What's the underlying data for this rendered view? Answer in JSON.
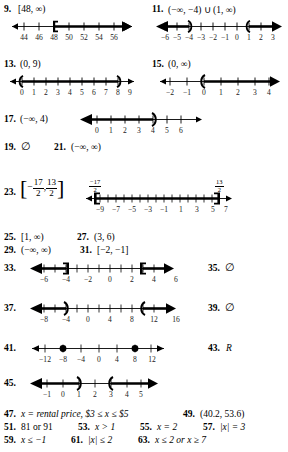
{
  "page": {
    "type": "answer-key",
    "background": "#ffffff",
    "ink": "#000000"
  },
  "exercises": [
    {
      "number": "9.",
      "answer": "[48, ∞)",
      "graph": {
        "ticks": [
          "44",
          "46",
          "48",
          "50",
          "52",
          "54",
          "56"
        ],
        "marks": [
          {
            "at": 2,
            "glyph": "[",
            "direction": "right"
          }
        ],
        "arrows": [
          "left",
          "right"
        ]
      }
    },
    {
      "number": "11.",
      "answer": "(−∞, −4) ∪ (1, ∞)",
      "graph": {
        "ticks": [
          "−6",
          "−5",
          "−4",
          "−3",
          "−2",
          "−1",
          "0",
          "1",
          "2",
          "3"
        ],
        "marks": [
          {
            "at": 2,
            "glyph": ")",
            "direction": "left"
          },
          {
            "at": 7,
            "glyph": "(",
            "direction": "right"
          }
        ],
        "arrows": [
          "left",
          "right"
        ]
      }
    },
    {
      "number": "13.",
      "answer": "(0, 9)",
      "graph": {
        "ticks": [
          "0",
          "1",
          "2",
          "3",
          "4",
          "5",
          "6",
          "7",
          "8",
          "9"
        ],
        "marks": [
          {
            "at": 0,
            "glyph": "(",
            "direction": "right"
          },
          {
            "at": 9,
            "glyph": ")",
            "direction": "left"
          }
        ],
        "arrows": [
          "left",
          "right"
        ]
      }
    },
    {
      "number": "15.",
      "answer": "(0, ∞)",
      "graph": {
        "ticks": [
          "−2",
          "−1",
          "0",
          "1",
          "2",
          "3",
          "4"
        ],
        "marks": [
          {
            "at": 2,
            "glyph": "(",
            "direction": "right"
          }
        ],
        "arrows": [
          "left",
          "right"
        ]
      }
    },
    {
      "number": "17.",
      "answer": "(−∞, 4)",
      "graph": {
        "ticks": [
          "0",
          "1",
          "2",
          "3",
          "4",
          "5",
          "6"
        ],
        "marks": [
          {
            "at": 4,
            "glyph": ")",
            "direction": "left"
          }
        ],
        "arrows": [
          "left",
          "right"
        ]
      }
    },
    {
      "number": "19.",
      "answer": "∅"
    },
    {
      "number": "21.",
      "answer": "(−∞, ∞)"
    },
    {
      "number": "23.",
      "answer_fraction": {
        "left_bracket": "[",
        "a_num": "17",
        "a_den": "2",
        "a_sign": "−",
        "b_num": "13",
        "b_den": "2",
        "right_bracket": "]"
      },
      "graph": {
        "ticks": [
          "−9",
          "−7",
          "−5",
          "−3",
          "−1",
          "1",
          "3",
          "5",
          "7"
        ],
        "endpoint_labels": [
          {
            "num": "17",
            "den": "2",
            "sign": "−",
            "side": "left"
          },
          {
            "num": "13",
            "den": "2",
            "sign": "",
            "side": "right"
          }
        ],
        "marks": [
          {
            "glyph": "[",
            "direction": "right"
          },
          {
            "glyph": "]",
            "direction": "left"
          }
        ],
        "arrows": [
          "left",
          "right"
        ]
      }
    },
    {
      "number": "25.",
      "answer": "[1, ∞)"
    },
    {
      "number": "27.",
      "answer": "(3, 6)"
    },
    {
      "number": "29.",
      "answer": "(−∞, ∞)"
    },
    {
      "number": "31.",
      "answer": "[−2, −1]"
    },
    {
      "number": "33.",
      "graph": {
        "ticks": [
          "−6",
          "",
          "−4",
          "",
          "−2",
          "",
          "0",
          "",
          "2",
          "",
          "4",
          "",
          "6"
        ],
        "marks": [
          {
            "at": 2,
            "glyph": "]",
            "direction": "left"
          },
          {
            "at": 10,
            "glyph": "[",
            "direction": "right"
          }
        ],
        "arrows": [
          "left",
          "right"
        ]
      }
    },
    {
      "number": "35.",
      "answer": "∅"
    },
    {
      "number": "37.",
      "graph": {
        "ticks": [
          "−8",
          "",
          "−4",
          "",
          "0",
          "",
          "4",
          "",
          "8",
          "",
          "12",
          "",
          "16"
        ],
        "marks": [
          {
            "at": 2,
            "glyph": ")",
            "direction": "left"
          },
          {
            "at": 10,
            "glyph": "(",
            "direction": "right"
          }
        ],
        "arrows": [
          "left",
          "right"
        ]
      }
    },
    {
      "number": "39.",
      "answer": "∅"
    },
    {
      "number": "41.",
      "graph": {
        "ticks": [
          "−12",
          "−8",
          "−4",
          "0",
          "4",
          "8",
          "12"
        ],
        "dots": [
          1,
          5
        ],
        "arrows": [
          "left",
          "right"
        ],
        "line": "thin"
      }
    },
    {
      "number": "43.",
      "answer": "R",
      "italic": true
    },
    {
      "number": "45.",
      "graph": {
        "ticks": [
          "−1",
          "0",
          "1",
          "2",
          "3",
          "4",
          "5"
        ],
        "marks": [
          {
            "at": 2,
            "glyph": ")",
            "direction": "left"
          },
          {
            "at": 4,
            "glyph": "(",
            "direction": "right"
          }
        ],
        "arrows": [
          "left",
          "right"
        ]
      }
    },
    {
      "number": "47.",
      "answer": "x = rental price, $3 ≤ x ≤ $5"
    },
    {
      "number": "49.",
      "answer": "(40.2, 53.6)"
    },
    {
      "number": "51.",
      "answer": "81 or 91"
    },
    {
      "number": "53.",
      "answer": "x > 1"
    },
    {
      "number": "55.",
      "answer": "x = 2"
    },
    {
      "number": "57.",
      "answer": "|x| = 3"
    },
    {
      "number": "59.",
      "answer": "x ≤ −1"
    },
    {
      "number": "61.",
      "answer": "|x| ≤ 2"
    },
    {
      "number": "63.",
      "answer": "x ≤ 2 or x ≥ 7"
    }
  ],
  "labels": {
    "ex9_ticks": [
      "44",
      "46",
      "48",
      "50",
      "52",
      "54",
      "56"
    ],
    "ex11_ticks": [
      "−6",
      "−5",
      "−4",
      "−3",
      "−2",
      "−1",
      "0",
      "1",
      "2",
      "3"
    ],
    "ex13_ticks": [
      "0",
      "1",
      "2",
      "3",
      "4",
      "5",
      "6",
      "7",
      "8",
      "9"
    ],
    "ex15_ticks": [
      "−2",
      "−1",
      "0",
      "1",
      "2",
      "3",
      "4"
    ],
    "ex17_ticks": [
      "0",
      "1",
      "2",
      "3",
      "4",
      "5",
      "6"
    ],
    "ex23_ticks": [
      "−9",
      "−7",
      "−5",
      "−3",
      "−1",
      "1",
      "3",
      "5",
      "7"
    ],
    "ex33_ticks": [
      "−6",
      "−4",
      "−2",
      "0",
      "2",
      "4",
      "6"
    ],
    "ex37_ticks": [
      "−8",
      "−4",
      "0",
      "4",
      "8",
      "12",
      "16"
    ],
    "ex41_ticks": [
      "−12",
      "−8",
      "−4",
      "0",
      "4",
      "8",
      "12"
    ],
    "ex45_ticks": [
      "−1",
      "0",
      "1",
      "2",
      "3",
      "4",
      "5"
    ]
  }
}
